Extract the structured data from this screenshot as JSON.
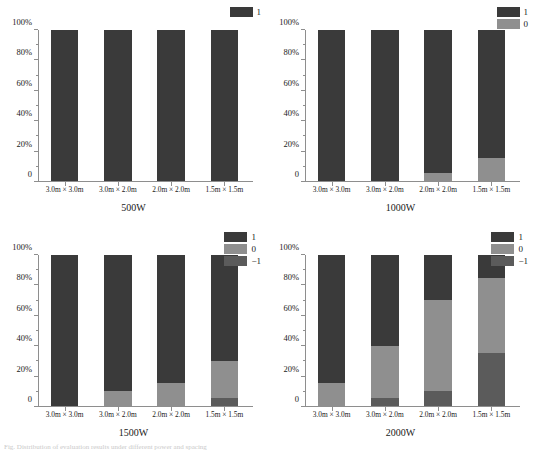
{
  "figure": {
    "caption_partial": "Fig.  Distribution of evaluation results under different power and spacing",
    "palette": {
      "level_1": "#3a3a3a",
      "level_0": "#8f8f8f",
      "level_minus1": "#5b5b5b",
      "axis": "#8e8e8e",
      "background": "#ffffff"
    },
    "x_categories": [
      "3.0m × 3.0m",
      "3.0m × 2.0m",
      "2.0m × 2.0m",
      "1.5m × 1.5m"
    ],
    "y_ticks": [
      "0",
      "20%",
      "40%",
      "60%",
      "80%",
      "100%"
    ]
  },
  "chart_data": [
    {
      "type": "bar",
      "title": "500W",
      "stacked": true,
      "xlabel": "",
      "ylabel": "",
      "ylim": [
        0,
        100
      ],
      "grid": false,
      "legend_position": "top-right",
      "categories": [
        "3.0m × 3.0m",
        "3.0m × 2.0m",
        "2.0m × 2.0m",
        "1.5m × 1.5m"
      ],
      "ticklabels": [
        "0",
        "20%",
        "40%",
        "60%",
        "80%",
        "100%"
      ],
      "series": [
        {
          "name": "1",
          "color": "#3a3a3a",
          "values": [
            100,
            100,
            100,
            100
          ]
        }
      ]
    },
    {
      "type": "bar",
      "title": "1000W",
      "stacked": true,
      "xlabel": "",
      "ylabel": "",
      "ylim": [
        0,
        100
      ],
      "grid": false,
      "legend_position": "top-right",
      "categories": [
        "3.0m × 3.0m",
        "3.0m × 2.0m",
        "2.0m × 2.0m",
        "1.5m × 1.5m"
      ],
      "ticklabels": [
        "0",
        "20%",
        "40%",
        "60%",
        "80%",
        "100%"
      ],
      "series": [
        {
          "name": "1",
          "color": "#3a3a3a",
          "values": [
            100,
            100,
            95,
            85
          ]
        },
        {
          "name": "0",
          "color": "#8f8f8f",
          "values": [
            0,
            0,
            5,
            15
          ]
        }
      ]
    },
    {
      "type": "bar",
      "title": "1500W",
      "stacked": true,
      "xlabel": "",
      "ylabel": "",
      "ylim": [
        0,
        100
      ],
      "grid": false,
      "legend_position": "top-right",
      "categories": [
        "3.0m × 3.0m",
        "3.0m × 2.0m",
        "2.0m × 2.0m",
        "1.5m × 1.5m"
      ],
      "ticklabels": [
        "0",
        "20%",
        "40%",
        "60%",
        "80%",
        "100%"
      ],
      "series": [
        {
          "name": "1",
          "color": "#3a3a3a",
          "values": [
            100,
            90,
            85,
            70
          ]
        },
        {
          "name": "0",
          "color": "#8f8f8f",
          "values": [
            0,
            10,
            15,
            25
          ]
        },
        {
          "name": "−1",
          "color": "#5b5b5b",
          "values": [
            0,
            0,
            0,
            5
          ]
        }
      ]
    },
    {
      "type": "bar",
      "title": "2000W",
      "stacked": true,
      "xlabel": "",
      "ylabel": "",
      "ylim": [
        0,
        100
      ],
      "grid": false,
      "legend_position": "top-right",
      "categories": [
        "3.0m × 3.0m",
        "3.0m × 2.0m",
        "2.0m × 2.0m",
        "1.5m × 1.5m"
      ],
      "ticklabels": [
        "0",
        "20%",
        "40%",
        "60%",
        "80%",
        "100%"
      ],
      "series": [
        {
          "name": "1",
          "color": "#3a3a3a",
          "values": [
            85,
            60,
            30,
            15
          ]
        },
        {
          "name": "0",
          "color": "#8f8f8f",
          "values": [
            15,
            35,
            60,
            50
          ]
        },
        {
          "name": "−1",
          "color": "#5b5b5b",
          "values": [
            0,
            5,
            10,
            35
          ]
        }
      ]
    }
  ]
}
